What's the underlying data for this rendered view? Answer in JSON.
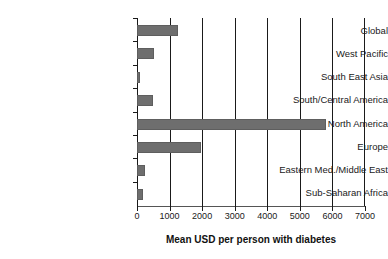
{
  "chart_data": {
    "type": "bar",
    "orientation": "horizontal",
    "title": "",
    "xlabel": "Mean USD per person with diabetes",
    "ylabel": "",
    "xlim": [
      0,
      7000
    ],
    "xticks": [
      0,
      1000,
      2000,
      3000,
      4000,
      5000,
      6000,
      7000
    ],
    "xtick_labels": [
      "0",
      "1000",
      "2000",
      "3000",
      "4000",
      "5000",
      "6000",
      "7000"
    ],
    "grid": "vertical",
    "legend": "none",
    "bar_color": "#6e6e6e",
    "categories": [
      "Global",
      "West Pacific",
      "South East Asia",
      "South/Central America",
      "North America",
      "Europe",
      "Eastern Med./Middle East",
      "Sub-Saharan Africa"
    ],
    "values": [
      1250,
      520,
      90,
      480,
      5800,
      1950,
      240,
      170
    ]
  }
}
